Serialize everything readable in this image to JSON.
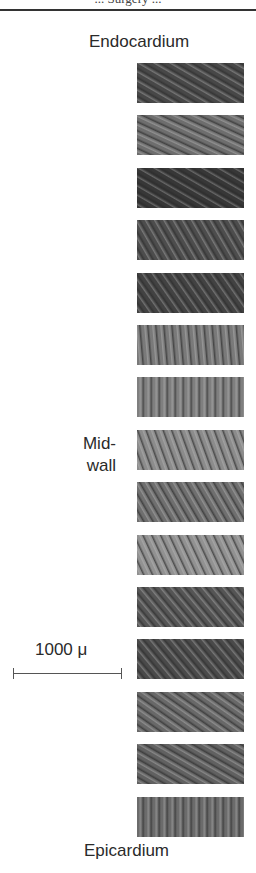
{
  "figure": {
    "caption_fragment": "... Surgery ...",
    "labels": {
      "top": "Endocardium",
      "middle_line1": "Mid-",
      "middle_line2": "wall",
      "bottom": "Epicardium"
    },
    "scale_bar": {
      "label": "1000 μ"
    },
    "panels": [
      {
        "id": 1,
        "tone": "#8a8a8a",
        "angle": 60
      },
      {
        "id": 2,
        "tone": "#a8a8a8",
        "angle": 65
      },
      {
        "id": 3,
        "tone": "#7a7a7a",
        "angle": 60
      },
      {
        "id": 4,
        "tone": "#8e8e8e",
        "angle": 30
      },
      {
        "id": 5,
        "tone": "#858585",
        "angle": 35
      },
      {
        "id": 6,
        "tone": "#b0b0b0",
        "angle": 5
      },
      {
        "id": 7,
        "tone": "#b4b4b4",
        "angle": 0
      },
      {
        "id": 8,
        "tone": "#bcbcbc",
        "angle": 20
      },
      {
        "id": 9,
        "tone": "#a9a9a9",
        "angle": 30
      },
      {
        "id": 10,
        "tone": "#c0c0c0",
        "angle": 25
      },
      {
        "id": 11,
        "tone": "#959595",
        "angle": 40
      },
      {
        "id": 12,
        "tone": "#8c8c8c",
        "angle": 40
      },
      {
        "id": 13,
        "tone": "#a4a4a4",
        "angle": 55
      },
      {
        "id": 14,
        "tone": "#9e9e9e",
        "angle": 60
      },
      {
        "id": 15,
        "tone": "#a6a6a6",
        "angle": 0
      }
    ]
  }
}
